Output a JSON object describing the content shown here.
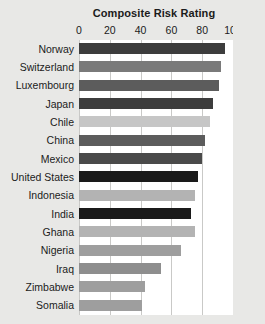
{
  "chart_data": {
    "type": "bar",
    "orientation": "horizontal",
    "title": "Composite Risk Rating",
    "xlabel": "",
    "ylabel": "",
    "xlim": [
      0,
      100
    ],
    "xticks": [
      0,
      20,
      40,
      60,
      80,
      100
    ],
    "xtick_labels": [
      "0",
      "20",
      "40",
      "60",
      "80",
      "100"
    ],
    "grid": true,
    "grid_axis": "x",
    "legend": false,
    "categories": [
      "Norway",
      "Switzerland",
      "Luxembourg",
      "Japan",
      "Chile",
      "China",
      "Mexico",
      "United States",
      "Indonesia",
      "India",
      "Ghana",
      "Nigeria",
      "Iraq",
      "Zimbabwe",
      "Somalia"
    ],
    "values": [
      95,
      92,
      91,
      87,
      85,
      82,
      80,
      77,
      75,
      73,
      75,
      66,
      53,
      43,
      41
    ],
    "bar_colors": [
      "#3d3d3d",
      "#7a7a7a",
      "#5c5c5c",
      "#3d3d3d",
      "#c6c6c6",
      "#5c5c5c",
      "#4a4a4a",
      "#1a1a1a",
      "#b3b3b3",
      "#1a1a1a",
      "#b3b3b3",
      "#9e9e9e",
      "#8e8e8e",
      "#9e9e9e",
      "#9e9e9e"
    ]
  },
  "colors": {
    "page_background": "#e8e8e6",
    "plot_background": "#ffffff",
    "gridline": "#c9c9c7",
    "text": "#1b1b1b"
  }
}
